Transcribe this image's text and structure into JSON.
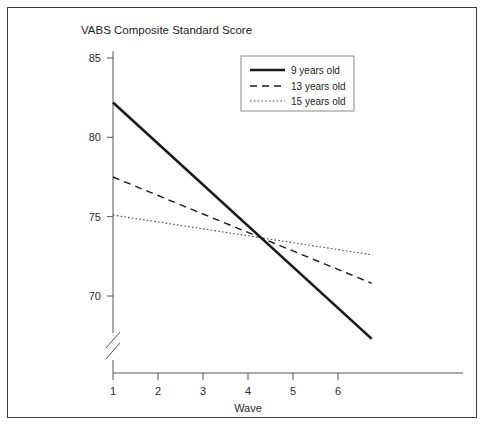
{
  "chart_data": {
    "type": "line",
    "title": "VABS Composite Standard Score",
    "xlabel": "Wave",
    "ylabel": "",
    "xlim": [
      0.55,
      7.0
    ],
    "ylim": [
      66.5,
      85.0
    ],
    "x_ticks": [
      1,
      2,
      3,
      4,
      5,
      6
    ],
    "x_tick_labels": [
      "1",
      "2",
      "3",
      "4",
      "5",
      "6"
    ],
    "y_ticks": [
      70,
      75,
      80,
      85
    ],
    "y_tick_labels": [
      "70",
      "75",
      "80",
      "85"
    ],
    "grid": false,
    "axis_break": true,
    "legend_position": "top-right",
    "series": [
      {
        "name": "9 years old",
        "style": "solid",
        "x": [
          1.0,
          6.75
        ],
        "values": [
          82.2,
          67.3
        ]
      },
      {
        "name": "13 years old",
        "style": "dashed",
        "x": [
          1.0,
          6.75
        ],
        "values": [
          77.5,
          70.8
        ]
      },
      {
        "name": "15 years old",
        "style": "dotted",
        "x": [
          1.0,
          6.75
        ],
        "values": [
          75.1,
          72.6
        ]
      }
    ],
    "annotations": []
  },
  "legend": {
    "entries": [
      {
        "label": "9 years old"
      },
      {
        "label": "13 years old"
      },
      {
        "label": "15 years old"
      }
    ]
  }
}
